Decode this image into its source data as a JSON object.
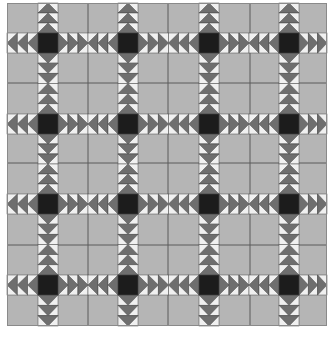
{
  "quilt": {
    "title": "Flying Geese Star Sashing Quilt",
    "origin": [
      7,
      3
    ],
    "size": [
      320,
      323
    ],
    "rows": 4,
    "cols": 4,
    "center_x": [
      38,
      118,
      199,
      279
    ],
    "center_y": [
      33,
      114,
      194,
      275
    ],
    "strip_width": 20,
    "goose_depth": 10,
    "dividers_x": [
      88,
      168,
      250
    ],
    "dividers_y": [
      83,
      163,
      245
    ],
    "colors": {
      "background": "#b5b5b5",
      "goose": "#6e6e6e",
      "goose_sky": "#f0f0f0",
      "center": "#1c1c1c",
      "outline": "#4a4a4a",
      "divider": "#5a5a5a",
      "border": "#8a8a8a"
    }
  }
}
